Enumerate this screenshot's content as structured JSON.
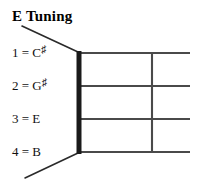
{
  "title": "E Tuning",
  "tuning": {
    "name": "E Tuning",
    "strings": [
      {
        "number": "1",
        "equals": "=",
        "note": "C",
        "accidental": "♯",
        "label": "1 = C♯"
      },
      {
        "number": "2",
        "equals": "=",
        "note": "G",
        "accidental": "♯",
        "label": "2 = G♯"
      },
      {
        "number": "3",
        "equals": "=",
        "note": "E",
        "accidental": "",
        "label": "3 = E"
      },
      {
        "number": "4",
        "equals": "=",
        "note": "B",
        "accidental": "",
        "label": "4 = B"
      }
    ]
  },
  "diagram": {
    "type": "fretboard",
    "string_count": 4,
    "fret_count": 1,
    "nut_color": "#1a1a1a",
    "string_color": "#4a4a4a",
    "fret_color": "#4a4a4a",
    "leader_color": "#2a2a2a",
    "background": "#ffffff",
    "nut_x": 78,
    "board_right_x": 190,
    "fret_x": 152,
    "string_y": [
      53,
      86,
      119,
      152
    ],
    "leader_top": {
      "x1": 22,
      "y1": 26,
      "x2": 78,
      "y2": 52
    },
    "leader_bottom": {
      "x1": 25,
      "y1": 178,
      "x2": 78,
      "y2": 153
    }
  }
}
